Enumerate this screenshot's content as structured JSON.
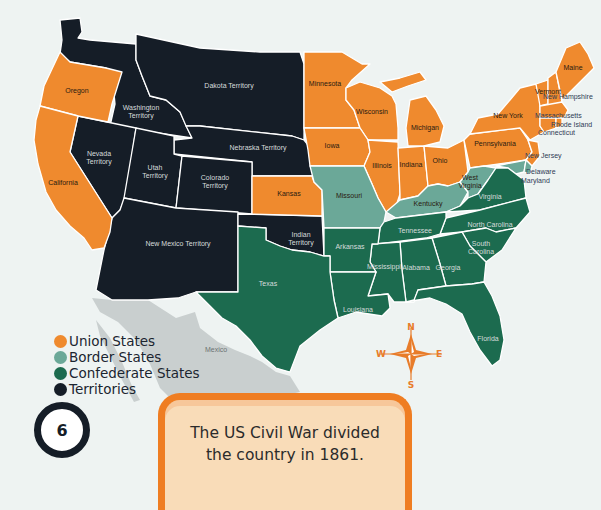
{
  "colors": {
    "union": "#ef8a2e",
    "border": "#6ba898",
    "confederate": "#1c6b4f",
    "territory": "#151d27",
    "mexico": "#c9cfcf",
    "background": "#eef3f2",
    "compass": "#e87c2a"
  },
  "legend": {
    "items": [
      {
        "label": "Union States",
        "color": "#ef8a2e"
      },
      {
        "label": "Border States",
        "color": "#6ba898"
      },
      {
        "label": "Confederate States",
        "color": "#1c6b4f"
      },
      {
        "label": "Territories",
        "color": "#151d27"
      }
    ]
  },
  "page_number": "6",
  "caption": {
    "line1": "The US Civil War divided",
    "line2": "the country in 1861."
  },
  "compass": {
    "n": "N",
    "s": "S",
    "e": "E",
    "w": "W"
  },
  "regions": {
    "oregon": "Oregon",
    "california": "California",
    "washington": [
      "Washington",
      "Territory"
    ],
    "dakota": "Dakota Territory",
    "nebraska": "Nebraska Territory",
    "nevada": [
      "Nevada",
      "Territory"
    ],
    "utah": [
      "Utah",
      "Territory"
    ],
    "colorado": [
      "Colorado",
      "Territory"
    ],
    "new_mexico": "New Mexico Territory",
    "indian": [
      "Indian",
      "Territory"
    ],
    "kansas": "Kansas",
    "minnesota": "Minnesota",
    "wisconsin": "Wisconsin",
    "iowa": "Iowa",
    "illinois": "Illinois",
    "indiana": "Indiana",
    "michigan": "Michigan",
    "ohio": "Ohio",
    "pennsylvania": "Pennsylvania",
    "new_york": "New York",
    "vermont": "Vermont",
    "maine": "Maine",
    "new_hampshire": "New Hampshire",
    "massachusetts": "Massachusetts",
    "rhode_island": "Rhode Island",
    "connecticut": "Connecticut",
    "new_jersey": "New Jersey",
    "delaware": "Delaware",
    "maryland": "Maryland",
    "missouri": "Missouri",
    "kentucky": "Kentucky",
    "west_virginia": [
      "West",
      "Virginia"
    ],
    "virginia": "Virginia",
    "north_carolina": "North Carolina",
    "south_carolina": [
      "South",
      "Carolina"
    ],
    "tennessee": "Tennessee",
    "arkansas": "Arkansas",
    "texas": "Texas",
    "louisiana": "Louisiana",
    "mississippi": "Mississippi",
    "alabama": "Alabama",
    "georgia": "Georgia",
    "florida": "Florida",
    "mexico": "Mexico"
  }
}
